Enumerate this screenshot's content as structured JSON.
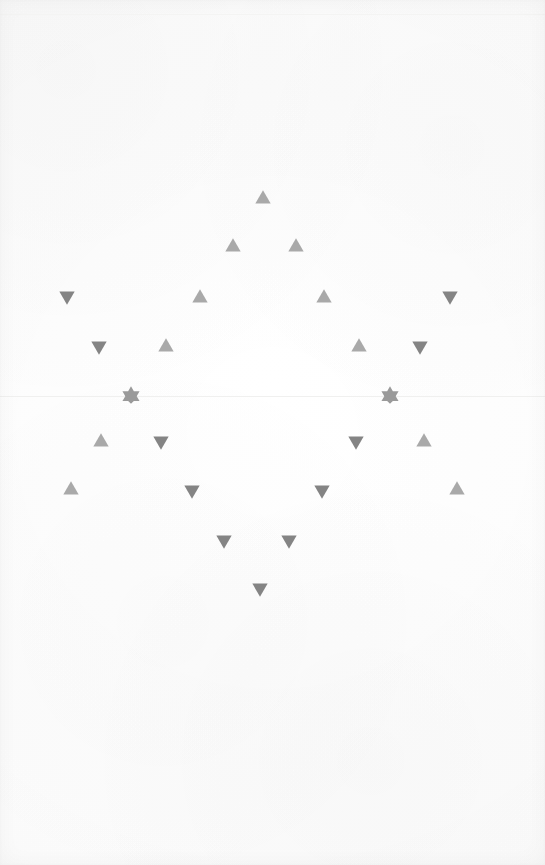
{
  "figure": {
    "kind": "scatter-plot",
    "background_color": "#fdfdfc",
    "width": 545,
    "height": 865,
    "title": "",
    "subtitle": "",
    "axis_labels": {
      "x": "",
      "y": ""
    },
    "legend": {
      "visible": false,
      "entries": []
    },
    "tick_labels": {
      "x": [],
      "y": []
    },
    "annotations": []
  },
  "axis_line": {
    "name": "horizontal-axis-line",
    "y": 396,
    "color": "#f0f0ef",
    "visible": true
  },
  "top_rule": {
    "name": "top-rule-line",
    "y": 14,
    "color": "#f4f4f3",
    "visible": true
  },
  "colors": {
    "triangle_up": "#a9a9a9",
    "triangle_down": "#848484",
    "star": "#9a9a9a",
    "background": "#fdfdfc",
    "axis": "#f0f0ef"
  },
  "chart_data": {
    "type": "scatter",
    "title": "",
    "xlabel": "",
    "ylabel": "",
    "xlim": [
      0,
      545
    ],
    "ylim": [
      865,
      0
    ],
    "grid": false,
    "legend_position": "none",
    "marker_size_px": 17,
    "series": [
      {
        "name": "triangle-up",
        "marker": "triangle-up",
        "color": "#a9a9a9",
        "points": [
          {
            "x": 263,
            "y": 197
          },
          {
            "x": 233,
            "y": 245
          },
          {
            "x": 296,
            "y": 245
          },
          {
            "x": 200,
            "y": 296
          },
          {
            "x": 324,
            "y": 296
          },
          {
            "x": 166,
            "y": 345
          },
          {
            "x": 359,
            "y": 345
          },
          {
            "x": 101,
            "y": 440
          },
          {
            "x": 424,
            "y": 440
          },
          {
            "x": 71,
            "y": 488
          },
          {
            "x": 457,
            "y": 488
          }
        ]
      },
      {
        "name": "triangle-down",
        "marker": "triangle-down",
        "color": "#848484",
        "points": [
          {
            "x": 67,
            "y": 298
          },
          {
            "x": 450,
            "y": 298
          },
          {
            "x": 99,
            "y": 348
          },
          {
            "x": 420,
            "y": 348
          },
          {
            "x": 161,
            "y": 443
          },
          {
            "x": 356,
            "y": 443
          },
          {
            "x": 192,
            "y": 492
          },
          {
            "x": 322,
            "y": 492
          },
          {
            "x": 224,
            "y": 542
          },
          {
            "x": 289,
            "y": 542
          },
          {
            "x": 260,
            "y": 590
          }
        ]
      },
      {
        "name": "star",
        "marker": "star-6",
        "color": "#9a9a9a",
        "points": [
          {
            "x": 131,
            "y": 395
          },
          {
            "x": 390,
            "y": 395
          }
        ]
      }
    ]
  }
}
